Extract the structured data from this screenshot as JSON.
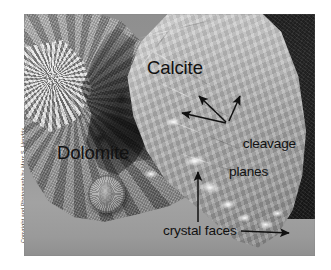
{
  "figure": {
    "kind": "annotated-geology-photograph"
  },
  "credit": {
    "text": "Copyright and Photograph by Marc S. Hendrix"
  },
  "labels": {
    "calcite": "Calcite",
    "dolomite": "Dolomite",
    "cleavage_line1": "cleavage",
    "cleavage_line2": "planes",
    "crystal_faces": "crystal faces"
  },
  "annotation_color": "#111111",
  "features": {
    "coin": "penny-scale-object",
    "backdrop": "dark-textured-fabric",
    "surface": "gray-table-surface"
  },
  "arrows": [
    {
      "name": "cleavage-arrow-upper-left",
      "points_to": "calcite cleavage facet"
    },
    {
      "name": "cleavage-arrow-upper-right",
      "points_to": "calcite cleavage facet"
    },
    {
      "name": "cleavage-arrow-left",
      "points_to": "calcite cleavage facet"
    },
    {
      "name": "crystal-faces-arrow-up",
      "points_to": "calcite crystal face"
    },
    {
      "name": "crystal-faces-arrow-right",
      "points_to": "calcite crystal tip"
    }
  ]
}
